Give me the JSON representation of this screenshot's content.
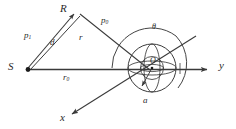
{
  "figure": {
    "type": "geometry-diagram",
    "stroke_color": "#3a3a3a",
    "background": "#ffffff"
  },
  "labels": {
    "source_point": "S",
    "receiver_point": "R",
    "sphere_center": "O",
    "axis_y": "y",
    "axis_x": "x",
    "distance_incident": "p",
    "distance_incident_sub": "1",
    "distance_scattered": "p",
    "distance_scattered_sub": "0",
    "distance_d": "d",
    "radius_vector": "r",
    "range_r0": "r",
    "range_r0_sub": "0",
    "sphere_radius": "a",
    "angle_theta": "θ"
  },
  "geometry": {
    "S": [
      27,
      70
    ],
    "R": [
      76,
      12
    ],
    "O": [
      152,
      68
    ],
    "sphere_radius": 24,
    "y_axis_end": [
      213,
      68
    ],
    "x_axis_arrow_end": [
      66,
      118
    ],
    "x_axis_far_end": [
      196,
      36
    ],
    "theta_arc_radius": 41
  }
}
